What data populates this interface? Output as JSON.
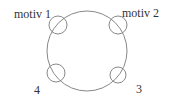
{
  "diagram": {
    "main_circle": {
      "cx": 87,
      "cy": 51,
      "r": 40,
      "stroke": "#888888"
    },
    "motifs": [
      {
        "label": "motiv 1",
        "cx": 58,
        "cy": 25,
        "r": 9,
        "label_x": 14,
        "label_y": 18
      },
      {
        "label": "motiv 2",
        "cx": 118,
        "cy": 25,
        "r": 9,
        "label_x": 122,
        "label_y": 17
      },
      {
        "label": "3",
        "cx": 118,
        "cy": 75,
        "r": 8,
        "label_x": 136,
        "label_y": 93
      },
      {
        "label": "4",
        "cx": 56,
        "cy": 73,
        "r": 9,
        "label_x": 34,
        "label_y": 94
      }
    ]
  }
}
